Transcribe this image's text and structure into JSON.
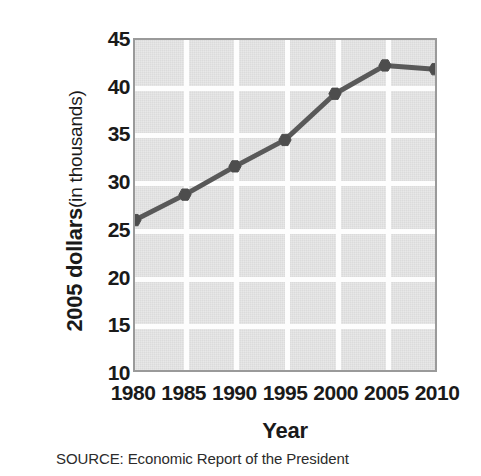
{
  "figure": {
    "source_note": "SOURCE: Economic Report of the President",
    "plot_bg_color": "#e2e2e2",
    "grid_color": "#fdfdfd",
    "frame_color": "#9a9a9a",
    "line_color": "#595959",
    "marker_color": "#4d4d4d"
  },
  "chart_data": {
    "type": "line",
    "title": "",
    "xlabel": "Year",
    "ylabel_main": "2005 dollars",
    "ylabel_sub": "(in thousands)",
    "ylabel": "2005 dollars (in thousands)",
    "x": [
      1980,
      1985,
      1990,
      1995,
      2000,
      2005,
      2010
    ],
    "xticklabels": [
      "1980",
      "1985",
      "1990",
      "1995",
      "2000",
      "2005",
      "2010"
    ],
    "yticklabels": [
      "45",
      "40",
      "35",
      "30",
      "25",
      "20",
      "15",
      "10"
    ],
    "yticks": [
      45,
      40,
      35,
      30,
      25,
      20,
      15,
      10
    ],
    "values": [
      25.9,
      28.6,
      31.6,
      34.4,
      39.3,
      42.3,
      41.9
    ],
    "series": [
      {
        "name": "2005 dollars (in thousands)",
        "values": [
          25.9,
          28.6,
          31.6,
          34.4,
          39.3,
          42.3,
          41.9
        ]
      }
    ],
    "xlim": [
      1980,
      2010
    ],
    "ylim": [
      10,
      45
    ],
    "grid": true,
    "legend": "none",
    "marker": "diamond"
  }
}
